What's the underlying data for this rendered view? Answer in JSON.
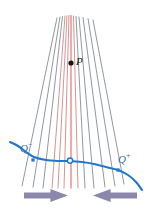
{
  "figure": {
    "background_color": "#ffffff",
    "width": 148,
    "height": 212,
    "labels": {
      "point_p": "P",
      "q_minus_base": "Q",
      "q_minus_sup": "−",
      "q_plus_base": "Q",
      "q_plus_sup": "+"
    },
    "colors": {
      "ray_gray": "#6b7280",
      "ray_red": "#c8746e",
      "axis_red": "#e03b3b",
      "curve_blue": "#1f77d0",
      "point_black": "#15171a",
      "arrow_purple": "#8b87ab",
      "label_blue": "#2f6fb5"
    },
    "focal_point": {
      "x": 71,
      "y": 63,
      "label": "P"
    },
    "tangency_point": {
      "x": 70,
      "y": 160,
      "marker": "open-circle"
    },
    "curve_markers": [
      {
        "name": "Q-minus",
        "x": 33,
        "y": 160,
        "marker": "filled-square"
      },
      {
        "name": "Q-plus",
        "x": 118,
        "y": 170,
        "marker": "filled-square"
      }
    ],
    "arrows": [
      {
        "name": "left-arrow",
        "direction": "right",
        "x": 24,
        "y": 189,
        "width": 44,
        "height": 13
      },
      {
        "name": "right-arrow",
        "direction": "left",
        "x": 93,
        "y": 189,
        "width": 44,
        "height": 13
      }
    ]
  },
  "chart_data": {
    "type": "line",
    "xlabel": "",
    "ylabel": "",
    "xlim": [
      0,
      148
    ],
    "ylim": [
      212,
      0
    ],
    "grid": false,
    "legend": null,
    "annotations": [
      {
        "text": "P",
        "x": 76,
        "y": 62
      },
      {
        "text": "Q−",
        "x": 25,
        "y": 148
      },
      {
        "text": "Q+",
        "x": 124,
        "y": 159
      }
    ],
    "series": [
      {
        "name": "blue-wavefront-curve",
        "color": "#1f77d0",
        "points": [
          [
            10,
            142
          ],
          [
            18,
            146
          ],
          [
            26,
            152
          ],
          [
            34,
            157
          ],
          [
            46,
            160
          ],
          [
            58,
            161
          ],
          [
            70,
            161
          ],
          [
            82,
            162
          ],
          [
            94,
            164
          ],
          [
            106,
            167
          ],
          [
            118,
            170
          ],
          [
            128,
            175
          ],
          [
            136,
            182
          ],
          [
            142,
            190
          ]
        ]
      },
      {
        "name": "ray-fan",
        "color": "#6b7280",
        "focus": [
          71,
          63
        ],
        "rays": [
          {
            "top": [
              57.0,
              18.0
            ],
            "bottom": [
              22.0,
              186.0
            ],
            "color": "#6b7280"
          },
          {
            "top": [
              60.0,
              17.0
            ],
            "bottom": [
              33.0,
              187.0
            ],
            "color": "#6b7280"
          },
          {
            "top": [
              62.5,
              16.5
            ],
            "bottom": [
              43.0,
              188.0
            ],
            "color": "#6b7280"
          },
          {
            "top": [
              65.0,
              16.0
            ],
            "bottom": [
              52.0,
              188.0
            ],
            "color": "#c8746e"
          },
          {
            "top": [
              67.0,
              16.0
            ],
            "bottom": [
              58.0,
              188.0
            ],
            "color": "#c8746e"
          },
          {
            "top": [
              69.0,
              15.5
            ],
            "bottom": [
              64.0,
              188.0
            ],
            "color": "#c8746e"
          },
          {
            "top": [
              71.0,
              15.5
            ],
            "bottom": [
              71.0,
              188.0
            ],
            "color": "#e03b3b"
          },
          {
            "top": [
              73.5,
              16.0
            ],
            "bottom": [
              78.0,
              188.0
            ],
            "color": "#c8746e"
          },
          {
            "top": [
              76.0,
              16.5
            ],
            "bottom": [
              85.0,
              188.0
            ],
            "color": "#6b7280"
          },
          {
            "top": [
              79.0,
              17.0
            ],
            "bottom": [
              94.0,
              188.0
            ],
            "color": "#6b7280"
          },
          {
            "top": [
              83.0,
              17.5
            ],
            "bottom": [
              105.0,
              187.0
            ],
            "color": "#6b7280"
          },
          {
            "top": [
              88.0,
              18.5
            ],
            "bottom": [
              115.0,
              186.0
            ],
            "color": "#6b7280"
          },
          {
            "top": [
              93.0,
              20.0
            ],
            "bottom": [
              124.0,
              184.0
            ],
            "color": "#6b7280"
          }
        ]
      }
    ]
  }
}
